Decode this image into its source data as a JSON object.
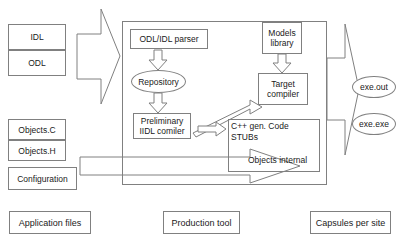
{
  "diagram": {
    "colors": {
      "stroke": "#808080",
      "text": "#1a1a1a",
      "background": "#ffffff"
    },
    "input_files": [
      {
        "label": "IDL"
      },
      {
        "label": "ODL"
      }
    ],
    "source_files": [
      {
        "label": "Objects.C"
      },
      {
        "label": "Objects.H"
      },
      {
        "label": "Configuration"
      }
    ],
    "production_tool": {
      "parser": "ODL/IDL parser",
      "repository": "Repository",
      "preliminary_compiler": "Preliminary\nIIDL comiler",
      "models_library": "Models\nlibrary",
      "target_compiler": "Target\ncompiler",
      "stubs_line1": "C++ gen. Code",
      "stubs_line2": "STUBs",
      "objects_internal": "Objects internal"
    },
    "outputs": [
      {
        "label": "exe.out"
      },
      {
        "label": "exe.exe"
      }
    ],
    "legend": [
      {
        "label": "Application files"
      },
      {
        "label": "Production tool"
      },
      {
        "label": "Capsules per site"
      }
    ],
    "arrows": {
      "input_to_tool": "big-right-arrow-inputs",
      "parser_to_repository": "down-arrow",
      "repository_to_preliminary": "down-arrow",
      "models_to_target": "down-arrow",
      "preliminary_to_target": "diagonal-up-right-arrow",
      "preliminary_to_stubs": "small-right-arrow",
      "sources_to_objects": "big-right-arrow-sources",
      "objects_to_outputs": "big-right-arrow-outputs"
    }
  }
}
